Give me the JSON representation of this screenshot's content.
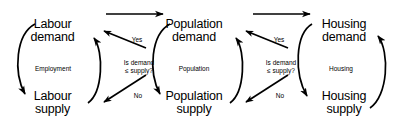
{
  "diagram": {
    "type": "causal-loop-flow-diagram",
    "background_color": "#ffffff",
    "stroke_color": "#000000",
    "nodes": [
      {
        "id": "labour-demand",
        "line1": "Labour",
        "line2": "demand"
      },
      {
        "id": "labour-supply",
        "line1": "Labour",
        "line2": "supply"
      },
      {
        "id": "population-demand",
        "line1": "Population",
        "line2": "demand"
      },
      {
        "id": "population-supply",
        "line1": "Population",
        "line2": "supply"
      },
      {
        "id": "housing-demand",
        "line1": "Housing",
        "line2": "demand"
      },
      {
        "id": "housing-supply",
        "line1": "Housing",
        "line2": "supply"
      }
    ],
    "loops": [
      {
        "id": "employment-loop",
        "label": "Employment"
      },
      {
        "id": "population-loop",
        "label": "Population"
      },
      {
        "id": "housing-loop",
        "label": "Housing"
      }
    ],
    "decisions": [
      {
        "id": "labour-decision",
        "question_line1": "Is demand",
        "question_line2": "≤ supply?",
        "yes_label": "Yes",
        "no_label": "No"
      },
      {
        "id": "population-decision",
        "question_line1": "Is demand",
        "question_line2": "≤ supply?",
        "yes_label": "Yes",
        "no_label": "No"
      }
    ],
    "connectors": [
      {
        "id": "labour-to-population-arrow",
        "from": "labour-demand",
        "to": "population-demand",
        "label": ""
      },
      {
        "id": "population-to-housing-arrow",
        "from": "population-demand",
        "to": "housing-demand",
        "label": ""
      }
    ]
  }
}
